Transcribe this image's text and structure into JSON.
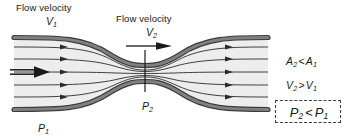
{
  "figure": {
    "background_color": "#ffffff",
    "width": 348,
    "height": 140
  },
  "pipe": {
    "wall_color": "#6e6e6e",
    "wall_edge_color": "#3c3c3c",
    "interior_color": "#ededed",
    "streamline_color": "#2b2b2b",
    "streamline_count": 5,
    "throat_x": 145
  },
  "labels": {
    "flow_velocity_1": "Flow velocity",
    "flow_velocity_2": "Flow velocity",
    "velocity_1_symbol": "V",
    "velocity_1_subscript": "1",
    "velocity_2_symbol": "V",
    "velocity_2_subscript": "2",
    "pressure_1_symbol": "P",
    "pressure_1_subscript": "1",
    "pressure_2_symbol": "P",
    "pressure_2_subscript": "2"
  },
  "relations": {
    "area": {
      "left_symbol": "A",
      "left_subscript": "2",
      "operator": "<",
      "right_symbol": "A",
      "right_subscript": "1",
      "full_text": "A2 < A1"
    },
    "velocity": {
      "left_symbol": "V",
      "left_subscript": "2",
      "operator": ">",
      "right_symbol": "V",
      "right_subscript": "1",
      "full_text": "V2 > V1"
    },
    "pressure": {
      "left_symbol": "P",
      "left_subscript": "2",
      "operator": "<",
      "right_symbol": "P",
      "right_subscript": "1",
      "full_text": "P2 < P1",
      "highlighted": true,
      "highlight_style": "dashed-box",
      "highlight_color": "#3a3a3a"
    }
  },
  "arrows": {
    "inlet_arrow_style": "double-line-solid-head",
    "velocity_2_arrow_style": "single-line-solid-head",
    "streamline_arrow_style": "small-solid-head"
  },
  "markers": {
    "throat_tick": "vertical-line"
  }
}
